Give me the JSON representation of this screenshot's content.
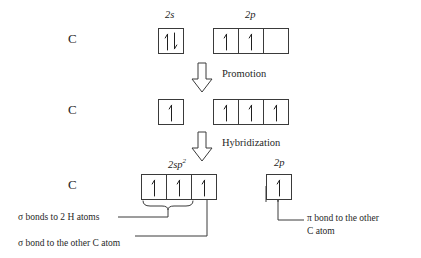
{
  "diagram": {
    "atom_symbol": "C",
    "stroke_color": "#3a3a3a",
    "text_color": "#1f1f1f"
  },
  "rows": [
    {
      "id": "ground-state",
      "atom": "C",
      "groups": [
        {
          "id": "2s-ground",
          "label_main": "2s",
          "label_sup": "",
          "boxes": [
            {
              "electrons": "up-down"
            }
          ]
        },
        {
          "id": "2p-ground",
          "label_main": "2p",
          "label_sup": "",
          "boxes": [
            {
              "electrons": "up"
            },
            {
              "electrons": "up"
            },
            {
              "electrons": "empty"
            }
          ]
        }
      ]
    },
    {
      "id": "promoted-state",
      "atom": "C",
      "groups": [
        {
          "id": "2s-promoted",
          "label_main": "",
          "label_sup": "",
          "boxes": [
            {
              "electrons": "up"
            }
          ]
        },
        {
          "id": "2p-promoted",
          "label_main": "",
          "label_sup": "",
          "boxes": [
            {
              "electrons": "up"
            },
            {
              "electrons": "up"
            },
            {
              "electrons": "up"
            }
          ]
        }
      ]
    },
    {
      "id": "hybridized-state",
      "atom": "C",
      "groups": [
        {
          "id": "2sp2-hybrid",
          "label_main": "2sp",
          "label_sup": "2",
          "boxes": [
            {
              "electrons": "up"
            },
            {
              "electrons": "up"
            },
            {
              "electrons": "up"
            }
          ]
        },
        {
          "id": "2p-remaining",
          "label_main": "2p",
          "label_sup": "",
          "boxes": [
            {
              "electrons": "up"
            }
          ]
        }
      ]
    }
  ],
  "processes": [
    {
      "id": "promotion",
      "label": "Promotion"
    },
    {
      "id": "hybridization",
      "label": "Hybridization"
    }
  ],
  "annotations": [
    {
      "id": "sigma-h-bonds",
      "text": "σ bonds to 2 H atoms"
    },
    {
      "id": "sigma-c-bond",
      "text": "σ bond to the other C atom"
    },
    {
      "id": "pi-c-bond-line1",
      "text": "π bond to the other"
    },
    {
      "id": "pi-c-bond-line2",
      "text": "C atom"
    }
  ]
}
